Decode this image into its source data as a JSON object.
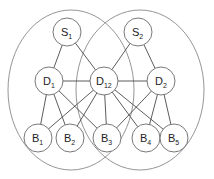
{
  "diagram": {
    "clusters": [
      {
        "id": "left",
        "cx": 71,
        "cy": 90,
        "rx": 63,
        "ry": 80
      },
      {
        "id": "right",
        "cx": 140,
        "cy": 90,
        "rx": 64,
        "ry": 80
      }
    ],
    "node_radius": 14,
    "nodes": [
      {
        "id": "S1",
        "base": "S",
        "sub": "1",
        "x": 67,
        "y": 32
      },
      {
        "id": "S2",
        "base": "S",
        "sub": "2",
        "x": 138,
        "y": 32
      },
      {
        "id": "D1",
        "base": "D",
        "sub": "1",
        "x": 49,
        "y": 81
      },
      {
        "id": "D12",
        "base": "D",
        "sub": "12",
        "x": 104,
        "y": 81
      },
      {
        "id": "D2",
        "base": "D",
        "sub": "2",
        "x": 161,
        "y": 81
      },
      {
        "id": "B1",
        "base": "B",
        "sub": "1",
        "x": 38,
        "y": 138
      },
      {
        "id": "B2",
        "base": "B",
        "sub": "2",
        "x": 70,
        "y": 138
      },
      {
        "id": "B3",
        "base": "B",
        "sub": "3",
        "x": 107,
        "y": 138
      },
      {
        "id": "B4",
        "base": "B",
        "sub": "4",
        "x": 146,
        "y": 138
      },
      {
        "id": "B5",
        "base": "B",
        "sub": "5",
        "x": 174,
        "y": 138
      }
    ],
    "edges": [
      [
        "S1",
        "D1"
      ],
      [
        "S1",
        "D12"
      ],
      [
        "S2",
        "D12"
      ],
      [
        "S2",
        "D2"
      ],
      [
        "D1",
        "D12"
      ],
      [
        "D12",
        "D2"
      ],
      [
        "D1",
        "B1"
      ],
      [
        "D1",
        "B2"
      ],
      [
        "D1",
        "B3"
      ],
      [
        "D12",
        "B1"
      ],
      [
        "D12",
        "B2"
      ],
      [
        "D12",
        "B3"
      ],
      [
        "D12",
        "B4"
      ],
      [
        "D12",
        "B5"
      ],
      [
        "D2",
        "B3"
      ],
      [
        "D2",
        "B4"
      ],
      [
        "D2",
        "B5"
      ]
    ]
  }
}
